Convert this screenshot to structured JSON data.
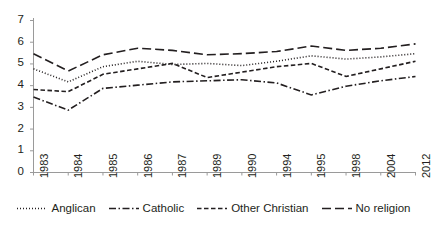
{
  "chart_data": {
    "type": "line",
    "title": "",
    "xlabel": "",
    "ylabel": "",
    "ylim": [
      0,
      7
    ],
    "yticks": [
      0,
      1,
      2,
      3,
      4,
      5,
      6,
      7
    ],
    "grid": false,
    "legend_position": "bottom",
    "categories": [
      "1983",
      "1984",
      "1985",
      "1986",
      "1987",
      "1989",
      "1990",
      "1994",
      "1995",
      "1998",
      "2004",
      "2012"
    ],
    "series": [
      {
        "name": "Anglican",
        "style": "dotted",
        "color": "#231f20",
        "values": [
          4.75,
          4.15,
          4.85,
          5.1,
          4.95,
          5.0,
          4.9,
          5.1,
          5.35,
          5.2,
          5.3,
          5.45
        ]
      },
      {
        "name": "Catholic",
        "style": "dash-dot",
        "color": "#231f20",
        "values": [
          3.45,
          2.85,
          3.85,
          4.0,
          4.15,
          4.2,
          4.25,
          4.1,
          3.55,
          3.95,
          4.2,
          4.4
        ]
      },
      {
        "name": "Other Christian",
        "style": "dashed-short",
        "color": "#231f20",
        "values": [
          3.8,
          3.7,
          4.5,
          4.75,
          5.0,
          4.35,
          4.6,
          4.85,
          5.0,
          4.4,
          4.75,
          5.1
        ]
      },
      {
        "name": "No religion",
        "style": "dashed-long",
        "color": "#231f20",
        "values": [
          5.45,
          4.65,
          5.4,
          5.7,
          5.6,
          5.4,
          5.45,
          5.55,
          5.8,
          5.6,
          5.7,
          5.9
        ]
      }
    ]
  },
  "axis": {
    "y_labels": [
      "7",
      "6",
      "5",
      "4",
      "3",
      "2",
      "1",
      "0"
    ],
    "x_labels": [
      "1983",
      "1984",
      "1985",
      "1986",
      "1987",
      "1989",
      "1990",
      "1994",
      "1995",
      "1998",
      "2004",
      "2012"
    ]
  },
  "legend": {
    "items": [
      {
        "label": "Anglican",
        "style": "dotted"
      },
      {
        "label": "Catholic",
        "style": "dash-dot"
      },
      {
        "label": "Other Christian",
        "style": "dashed-short"
      },
      {
        "label": "No religion",
        "style": "dashed-long"
      }
    ]
  },
  "colors": {
    "ink": "#231f20",
    "axis": "#9a9a9a",
    "background": "#ffffff"
  }
}
